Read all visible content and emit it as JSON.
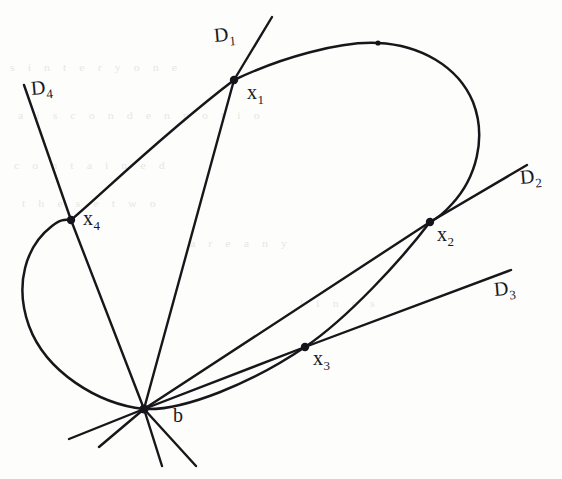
{
  "figure": {
    "kind": "hand-drawn-geometry-diagram",
    "background_color": "#fdfdfc",
    "ink_color": "#17161a",
    "width": 562,
    "height": 479
  },
  "labels": {
    "base_point": "b",
    "line_1": {
      "base": "D",
      "sub": "1"
    },
    "line_2": {
      "base": "D",
      "sub": "2"
    },
    "line_3": {
      "base": "D",
      "sub": "3"
    },
    "line_4": {
      "base": "D",
      "sub": "4"
    },
    "point_1": {
      "base": "x",
      "sub": "1"
    },
    "point_2": {
      "base": "x",
      "sub": "2"
    },
    "point_3": {
      "base": "x",
      "sub": "3"
    },
    "point_4": {
      "base": "x",
      "sub": "4"
    }
  },
  "points": [
    {
      "name": "x1",
      "x": 234,
      "y": 80
    },
    {
      "name": "x2",
      "x": 430,
      "y": 222
    },
    {
      "name": "x3",
      "x": 305,
      "y": 347
    },
    {
      "name": "x4",
      "x": 71,
      "y": 220
    },
    {
      "name": "b",
      "x": 144,
      "y": 409
    },
    {
      "name": "apex",
      "x": 378,
      "y": 43
    }
  ],
  "lines": [
    {
      "name": "D1",
      "from": [
        272,
        17
      ],
      "to": [
        162,
        466
      ]
    },
    {
      "name": "D2",
      "from": [
        144,
        409
      ],
      "to": [
        527,
        165
      ]
    },
    {
      "name": "D3",
      "from": [
        144,
        409
      ],
      "to": [
        511,
        270
      ]
    },
    {
      "name": "D4",
      "from": [
        24,
        85
      ],
      "to": [
        196,
        466
      ]
    }
  ],
  "label_positions": {
    "D1": {
      "x": 214,
      "y": 24
    },
    "D2": {
      "x": 520,
      "y": 166
    },
    "D3": {
      "x": 494,
      "y": 278
    },
    "D4": {
      "x": 31,
      "y": 77
    },
    "x1": {
      "x": 247,
      "y": 82
    },
    "x2": {
      "x": 437,
      "y": 224
    },
    "x3": {
      "x": 313,
      "y": 348
    },
    "x4": {
      "x": 83,
      "y": 208
    },
    "b": {
      "x": 173,
      "y": 405
    }
  },
  "ghost_text": [
    {
      "text": "s  i  n  t  e  r  y  o  n  e",
      "x": 10,
      "y": 60
    },
    {
      "text": "a  i  s  c  o  n  d  e  n  n  o  t  i  o",
      "x": 18,
      "y": 108
    },
    {
      "text": "c   o   n   t   a   i   n   e   d",
      "x": 14,
      "y": 158
    },
    {
      "text": "t   h   e   s   e   t   w   o",
      "x": 22,
      "y": 196
    },
    {
      "text": "a   r   e   a   n   y",
      "x": 190,
      "y": 236
    },
    {
      "text": "l   i   n   e   s",
      "x": 300,
      "y": 296
    }
  ]
}
